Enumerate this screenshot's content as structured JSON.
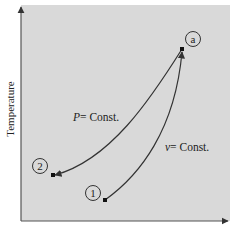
{
  "diagram": {
    "type": "T-v process diagram",
    "axes": {
      "y_label": "Temperature",
      "x_label": ""
    },
    "points": [
      {
        "id": "a",
        "label": "a"
      },
      {
        "id": "1",
        "label": "1"
      },
      {
        "id": "2",
        "label": "2"
      }
    ],
    "processes": [
      {
        "name": "P=Const.",
        "var": "P",
        "text": "= Const.",
        "from": "a",
        "to": "2"
      },
      {
        "name": "v=Const.",
        "var": "v",
        "text": "= Const.",
        "from": "1",
        "to": "a"
      }
    ],
    "colors": {
      "background": "#d8d8d8",
      "line": "#333333",
      "axis": "#555555"
    }
  }
}
